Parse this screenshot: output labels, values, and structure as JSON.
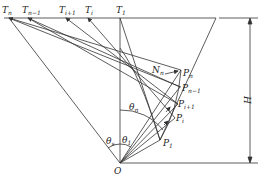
{
  "diagram": {
    "labels": {
      "Tn": "T",
      "Tn_sub": "n",
      "Tn1": "T",
      "Tn1_sub": "n−1",
      "Ti1": "T",
      "Ti1_sub": "i+1",
      "Ti": "T",
      "Ti_sub": "i",
      "T1": "T",
      "T1_sub": "1",
      "Nn": "N",
      "Nn_sub": "n",
      "Pn": "P",
      "Pn_sub": "n",
      "Pn1": "P",
      "Pn1_sub": "n−1",
      "Pi1": "P",
      "Pi1_sub": "i+1",
      "Pi": "P",
      "Pi_sub": "i",
      "P1": "P",
      "P1_sub": "1",
      "theta_n": "θ",
      "theta_n_sub": "n",
      "theta_s": "θ",
      "theta_s_sub": "s",
      "theta_1": "θ",
      "theta_1_sub": "1",
      "O": "O",
      "H": "H"
    },
    "colors": {
      "line": "#333333",
      "background": "#ffffff"
    }
  }
}
